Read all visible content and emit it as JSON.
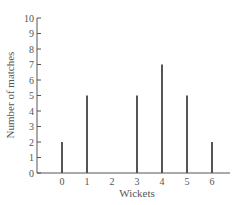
{
  "chart_data": {
    "type": "bar",
    "title": "",
    "xlabel": "Wickets",
    "ylabel": "Number of matches",
    "categories": [
      "0",
      "1",
      "2",
      "3",
      "4",
      "5",
      "6"
    ],
    "values": [
      2,
      5,
      0,
      5,
      7,
      5,
      2
    ],
    "yticks": [
      "0",
      "1",
      "2",
      "3",
      "4",
      "5",
      "6",
      "7",
      "8",
      "9",
      "10"
    ],
    "ylim": [
      0,
      10
    ],
    "grid": false,
    "legend": "none",
    "style": "vertical line chart"
  }
}
